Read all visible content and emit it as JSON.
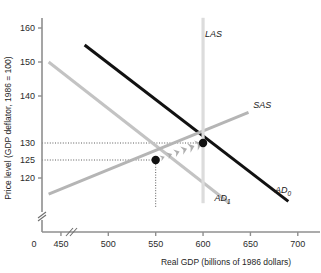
{
  "chart_data": {
    "type": "line",
    "title": "",
    "xlabel": "Real GDP (billions of 1986 dollars)",
    "ylabel": "Price level (GDP deflator, 1986 = 100)",
    "xlim": [
      430,
      715
    ],
    "ylim": [
      112,
      164
    ],
    "grid": false,
    "legend_position": "inline-curve-labels",
    "x_ticks": [
      "450",
      "500",
      "550",
      "600",
      "650",
      "700"
    ],
    "x_tick_values": [
      450,
      500,
      550,
      600,
      650,
      700
    ],
    "x_origin_label": "0",
    "x_axis_break": true,
    "y_ticks": [
      "120",
      "125",
      "130",
      "140",
      "150",
      "160"
    ],
    "y_tick_values": [
      120,
      125,
      130,
      140,
      150,
      160
    ],
    "y_axis_break": true,
    "series": [
      {
        "name": "AD₀",
        "label": "AD",
        "subscript": "0",
        "kind": "aggregate-demand",
        "color": "#111111",
        "width": 3.0,
        "x": [
          475,
          690
        ],
        "y": [
          155,
          113.5
        ]
      },
      {
        "name": "AD₁",
        "label": "AD",
        "subscript": "1",
        "kind": "aggregate-demand-shifted",
        "color": "#c3c3c3",
        "width": 3.0,
        "x": [
          437,
          628
        ],
        "y": [
          150,
          113.0
        ]
      },
      {
        "name": "SAS",
        "label": "SAS",
        "subscript": "",
        "kind": "short-run-aggregate-supply",
        "color": "#b5b5b5",
        "width": 3.0,
        "x": [
          437,
          648
        ],
        "y": [
          115.5,
          136.5
        ]
      },
      {
        "name": "LAS",
        "label": "LAS",
        "subscript": "",
        "kind": "long-run-aggregate-supply",
        "color": "#dcdcdc",
        "width": 3.2,
        "x": [
          600,
          600
        ],
        "y": [
          113.0,
          163.0
        ]
      }
    ],
    "points": [
      {
        "name": "initial-equilibrium",
        "x": 600,
        "y": 130,
        "color": "#111111",
        "radius": 4.2
      },
      {
        "name": "new-equilibrium",
        "x": 550,
        "y": 125,
        "color": "#111111",
        "radius": 4.2
      }
    ],
    "reference_lines": [
      {
        "name": "price-130-guide",
        "axis": "y",
        "value": 130,
        "from_x": 430,
        "to_x": 600,
        "style": "dotted"
      },
      {
        "name": "price-125-guide",
        "axis": "y",
        "value": 125,
        "from_x": 430,
        "to_x": 550,
        "style": "dotted"
      },
      {
        "name": "gdp-550-guide",
        "axis": "x",
        "value": 550,
        "from_y": 112,
        "to_y": 125,
        "style": "dotted"
      }
    ],
    "annotations": [
      {
        "name": "adjustment-arrow",
        "kind": "chevron-arrow",
        "from": {
          "x": 550,
          "y": 125
        },
        "to": {
          "x": 600,
          "y": 130
        },
        "color": "#a8a8a8",
        "direction": "up-right"
      }
    ],
    "curve_label_positions": [
      {
        "name": "LAS",
        "x": 602,
        "y": 157.5
      },
      {
        "name": "SAS",
        "x": 653,
        "y": 137.5
      },
      {
        "name": "AD0",
        "x": 676,
        "y": 115.8
      },
      {
        "name": "AD1",
        "x": 612,
        "y": 113.6
      }
    ]
  }
}
